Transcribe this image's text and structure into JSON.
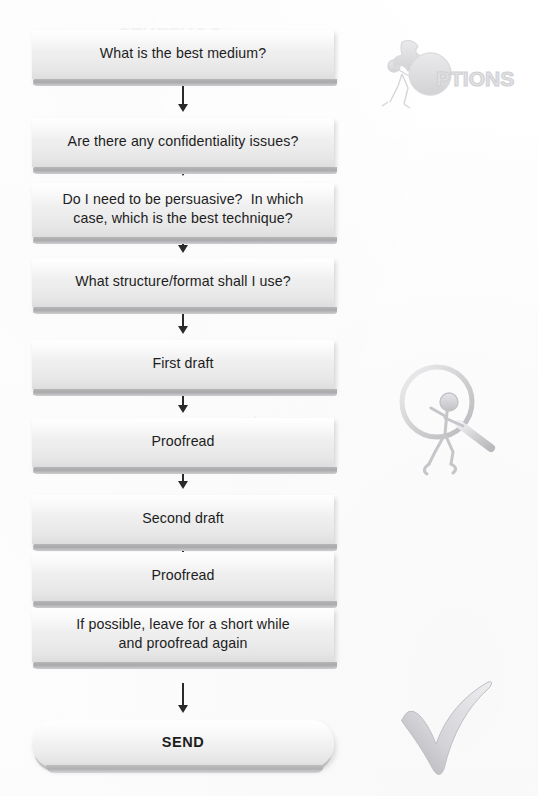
{
  "page": {
    "width": 538,
    "height": 796,
    "background_color": "#ffffff"
  },
  "theme": {
    "box_fill_light": "#fbfbfb",
    "box_fill_dark": "#dcdcdc",
    "box_shadow": "#9a9a9c",
    "text_color": "#1d1d1d",
    "arrow_color": "#2a2a2a",
    "clipart_color": "#c9c9cb",
    "ghost_text_color": "#78787d"
  },
  "flow": {
    "name": "writing-process-flow",
    "orientation": "vertical",
    "nodes": [
      {
        "id": "node-1",
        "shape": "rect",
        "lines": [
          "What is the best medium?"
        ],
        "text": "What is the best medium?",
        "top": 30,
        "height": 50
      },
      {
        "id": "node-2",
        "shape": "rect",
        "lines": [
          "Are there any confidentiality issues?"
        ],
        "text": "Are there any confidentiality issues?",
        "top": 118,
        "height": 50
      },
      {
        "id": "node-3",
        "shape": "rect",
        "lines": [
          "Do I need to be persuasive?  In which",
          "case, which is the best technique?"
        ],
        "text": "Do I need to be persuasive?  In which case, which is the best technique?",
        "top": 183,
        "height": 55
      },
      {
        "id": "node-4",
        "shape": "rect",
        "lines": [
          "What structure/format shall I use?"
        ],
        "text": "What structure/format shall I use?",
        "top": 258,
        "height": 50
      },
      {
        "id": "node-5",
        "shape": "rect",
        "lines": [
          "First draft"
        ],
        "text": "First draft",
        "top": 340,
        "height": 50
      },
      {
        "id": "node-6",
        "shape": "rect",
        "lines": [
          "Proofread"
        ],
        "text": "Proofread",
        "top": 418,
        "height": 50
      },
      {
        "id": "node-7",
        "shape": "rect",
        "lines": [
          "Second draft"
        ],
        "text": "Second draft",
        "top": 495,
        "height": 50
      },
      {
        "id": "node-8",
        "shape": "rect",
        "lines": [
          "Proofread"
        ],
        "text": "Proofread",
        "top": 552,
        "height": 50
      },
      {
        "id": "node-9",
        "shape": "rect",
        "lines": [
          "If possible, leave for a short while",
          "and proofread again"
        ],
        "text": "If possible, leave for a short while and proofread again",
        "top": 608,
        "height": 55
      },
      {
        "id": "node-10",
        "shape": "pill",
        "lines": [
          "SEND"
        ],
        "text": "SEND",
        "top": 720,
        "height": 48
      }
    ],
    "connectors": [
      {
        "id": "arrow-1",
        "from": "node-1",
        "to": "node-2",
        "top": 86,
        "length": 26,
        "direction": "down"
      },
      {
        "id": "arrow-2",
        "from": "node-2",
        "to": "node-3",
        "top": 150,
        "length": 26,
        "direction": "down"
      },
      {
        "id": "arrow-3",
        "from": "node-3",
        "to": "node-4",
        "top": 227,
        "length": 26,
        "direction": "down"
      },
      {
        "id": "arrow-4",
        "from": "node-4",
        "to": "node-5",
        "top": 308,
        "length": 26,
        "direction": "down"
      },
      {
        "id": "arrow-5",
        "from": "node-5",
        "to": "node-6",
        "top": 387,
        "length": 26,
        "direction": "down"
      },
      {
        "id": "arrow-6",
        "from": "node-6",
        "to": "node-7",
        "top": 463,
        "length": 26,
        "direction": "down"
      },
      {
        "id": "arrow-7",
        "from": "node-7",
        "to": "node-8",
        "top": 541,
        "length": 26,
        "direction": "down"
      },
      {
        "id": "arrow-8",
        "from": "node-8",
        "to": "node-9",
        "top": 599,
        "length": 26,
        "direction": "down"
      },
      {
        "id": "arrow-9",
        "from": "node-9",
        "to": "node-10",
        "top": 683,
        "length": 30,
        "direction": "down"
      }
    ]
  },
  "clipart": [
    {
      "id": "options-figure",
      "name": "options-puzzle-figure-clipart",
      "label": "OPTIONS",
      "description": "stick figure assembling puzzle pieces spelling OPTIONS",
      "left": 378,
      "top": 24,
      "width": 150,
      "height": 92
    },
    {
      "id": "magnifier-figure",
      "name": "magnifying-glass-figure-clipart",
      "label": "",
      "description": "stick figure carrying a large magnifying glass",
      "left": 395,
      "top": 360,
      "width": 120,
      "height": 118
    },
    {
      "id": "check-mark",
      "name": "check-mark-clipart",
      "label": "",
      "description": "large hand-drawn grey check mark",
      "left": 400,
      "top": 668,
      "width": 120,
      "height": 118
    }
  ],
  "ghost_text": [
    {
      "id": "ghost-1",
      "text": "CONTENTS",
      "left": 118,
      "top": 24,
      "size": 19
    },
    {
      "id": "ghost-2",
      "text": "communication skills",
      "left": 92,
      "top": 120,
      "size": 12
    },
    {
      "id": "ghost-3",
      "text": "what you say",
      "left": 196,
      "top": 414,
      "size": 11
    },
    {
      "id": "ghost-4",
      "text": "be prepared",
      "left": 172,
      "top": 554,
      "size": 11
    }
  ]
}
